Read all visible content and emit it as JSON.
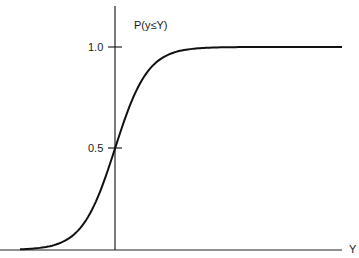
{
  "chart_data": {
    "type": "line",
    "title": "",
    "xlabel": "Y",
    "ylabel": "P(y≤Y)",
    "ytick_labels": [
      "0.5",
      "1.0"
    ],
    "yticks": [
      0.5,
      1.0
    ],
    "xticks": [],
    "ylim": [
      0,
      1.2
    ],
    "grid": false,
    "legend": null,
    "series": [
      {
        "name": "cumulative distribution function",
        "description": "Sigmoid CDF centered at the vertical axis (value 0.5 at x=0), approaching 0 on the left and 1.0 on the right",
        "x": [
          -3.0,
          -2.5,
          -2.0,
          -1.5,
          -1.0,
          -0.5,
          0.0,
          0.5,
          1.0,
          1.5,
          2.0,
          2.5,
          3.0,
          4.0,
          5.0,
          6.0,
          7.0
        ],
        "values": [
          0.0,
          0.01,
          0.03,
          0.08,
          0.18,
          0.33,
          0.5,
          0.67,
          0.82,
          0.92,
          0.97,
          0.99,
          1.0,
          1.0,
          1.0,
          1.0,
          1.0
        ]
      }
    ]
  },
  "labels": {
    "y_axis_title": "P(y≤Y)",
    "x_axis_title": "Y",
    "tick_high": "1.0",
    "tick_mid": "0.5"
  },
  "colors": {
    "line": "#111111",
    "axis": "#222222",
    "background": "#ffffff"
  }
}
